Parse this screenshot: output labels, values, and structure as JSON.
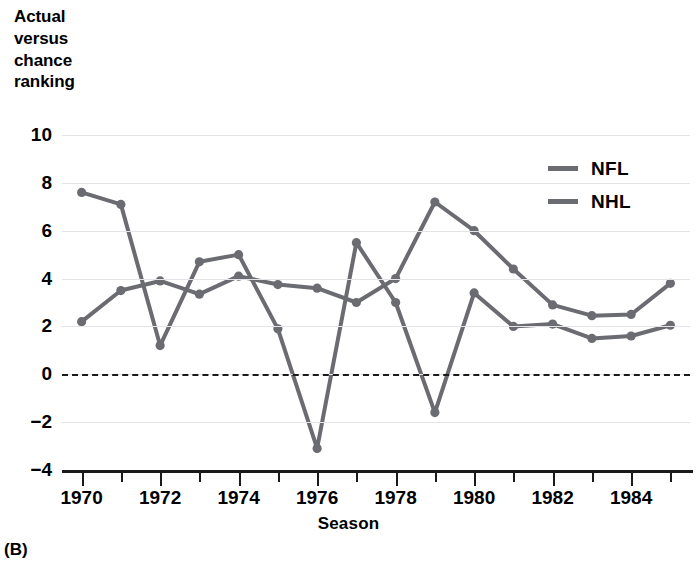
{
  "panel": {
    "label": "(B)"
  },
  "chart_data": {
    "type": "line",
    "title": "",
    "ylabel_lines": [
      "Actual",
      "versus",
      "chance",
      "ranking"
    ],
    "xlabel": "Season",
    "x": [
      1970,
      1971,
      1972,
      1973,
      1974,
      1975,
      1976,
      1977,
      1978,
      1979,
      1980,
      1981,
      1982,
      1983,
      1984,
      1985
    ],
    "xtick_labels": [
      "1970",
      "1972",
      "1974",
      "1976",
      "1978",
      "1980",
      "1982",
      "1984"
    ],
    "xtick_values": [
      1970,
      1972,
      1974,
      1976,
      1978,
      1980,
      1982,
      1984
    ],
    "xlim": [
      1969.5,
      1985.5
    ],
    "ytick_labels": [
      "10",
      "8",
      "6",
      "4",
      "2",
      "0",
      "−2",
      "−4"
    ],
    "ytick_values": [
      10,
      8,
      6,
      4,
      2,
      0,
      -2,
      -4
    ],
    "ylim": [
      -4,
      10
    ],
    "grid": true,
    "zero_reference_line": 0,
    "legend_position": "top-right",
    "series": [
      {
        "name": "NFL",
        "color": "#6b6b72",
        "values": [
          7.6,
          7.1,
          1.2,
          4.7,
          5.0,
          1.9,
          -3.1,
          5.5,
          3.0,
          -1.6,
          3.4,
          2.0,
          2.1,
          1.5,
          1.6,
          2.05
        ]
      },
      {
        "name": "NHL",
        "color": "#6b6b72",
        "values": [
          2.2,
          3.5,
          3.9,
          3.35,
          4.1,
          3.75,
          3.6,
          3.0,
          4.0,
          7.2,
          6.0,
          4.4,
          2.9,
          2.45,
          2.5,
          3.8
        ]
      }
    ]
  },
  "legend": {
    "items": [
      {
        "label": "NFL"
      },
      {
        "label": "NHL"
      }
    ]
  }
}
